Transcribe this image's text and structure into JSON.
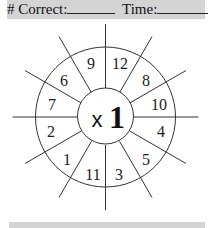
{
  "header": {
    "correct_label": "# Correct:",
    "time_label": "Time:"
  },
  "wheel": {
    "operator": "x",
    "factor": "1",
    "numbers": [
      {
        "value": "9",
        "x": 91,
        "y": 69
      },
      {
        "value": "12",
        "x": 120,
        "y": 69
      },
      {
        "value": "8",
        "x": 146,
        "y": 86
      },
      {
        "value": "10",
        "x": 159,
        "y": 110
      },
      {
        "value": "4",
        "x": 161,
        "y": 137
      },
      {
        "value": "5",
        "x": 146,
        "y": 165
      },
      {
        "value": "3",
        "x": 119,
        "y": 180
      },
      {
        "value": "11",
        "x": 93,
        "y": 180
      },
      {
        "value": "1",
        "x": 67,
        "y": 165
      },
      {
        "value": "2",
        "x": 51,
        "y": 137
      },
      {
        "value": "7",
        "x": 52,
        "y": 110
      },
      {
        "value": "6",
        "x": 64,
        "y": 86
      }
    ]
  }
}
